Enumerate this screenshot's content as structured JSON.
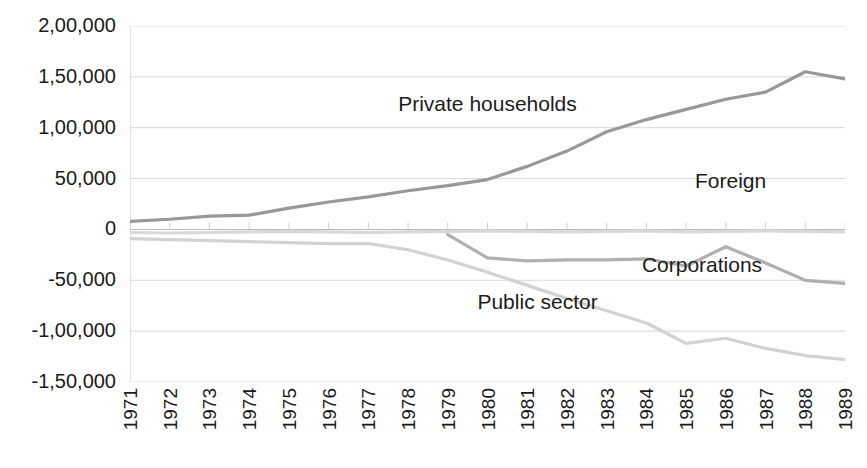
{
  "chart_data": {
    "type": "line",
    "title": "",
    "xlabel": "",
    "ylabel": "",
    "categories": [
      "1971",
      "1972",
      "1973",
      "1974",
      "1975",
      "1976",
      "1977",
      "1978",
      "1979",
      "1980",
      "1981",
      "1982",
      "1983",
      "1984",
      "1985",
      "1986",
      "1987",
      "1988",
      "1989"
    ],
    "ylim": [
      -150000,
      200000
    ],
    "ytick_labels": [
      "2,00,000",
      "1,50,000",
      "1,00,000",
      "50,000",
      "0",
      "-50,000",
      "-1,00,000",
      "-1,50,000"
    ],
    "ytick_values": [
      200000,
      150000,
      100000,
      50000,
      0,
      -50000,
      -100000,
      -150000
    ],
    "grid": true,
    "legend_position": "inline-annotations",
    "series": [
      {
        "name": "Private households",
        "color": "#989898",
        "values": [
          8000,
          10000,
          13000,
          14000,
          21000,
          27000,
          32000,
          38000,
          43000,
          49000,
          62000,
          77000,
          96000,
          108000,
          118000,
          128000,
          135000,
          155000,
          148000
        ]
      },
      {
        "name": "Foreign",
        "color": "#d8d8d8",
        "values": [
          -3000,
          -3500,
          -3000,
          -2500,
          -2000,
          -2500,
          -3000,
          -2500,
          -2000,
          -1500,
          -2000,
          -2500,
          -2000,
          -1500,
          -2500,
          -2000,
          -1500,
          -2000,
          -2500
        ]
      },
      {
        "name": "Corporations",
        "color": "#b0b0b0",
        "values": [
          null,
          null,
          null,
          null,
          null,
          null,
          null,
          null,
          -5000,
          -28000,
          -31000,
          -30000,
          -30000,
          -29000,
          -36000,
          -17000,
          -33000,
          -50000,
          -53000
        ]
      },
      {
        "name": "Public sector",
        "color": "#d2d2d2",
        "values": [
          -9000,
          -10000,
          -11000,
          -12000,
          -13000,
          -14000,
          -14000,
          -20000,
          -30000,
          -42000,
          -55000,
          -68000,
          -80000,
          -92000,
          -112000,
          -107000,
          -117000,
          -124000,
          -128000
        ]
      }
    ],
    "annotations": [
      {
        "text": "Private households",
        "x_pct": 50.0,
        "y_pct": 22.0
      },
      {
        "text": "Foreign",
        "x_pct": 84.0,
        "y_pct": 43.5
      },
      {
        "text": "Corporations",
        "x_pct": 80.0,
        "y_pct": 67.0
      },
      {
        "text": "Public sector",
        "x_pct": 57.0,
        "y_pct": 77.5
      }
    ]
  }
}
